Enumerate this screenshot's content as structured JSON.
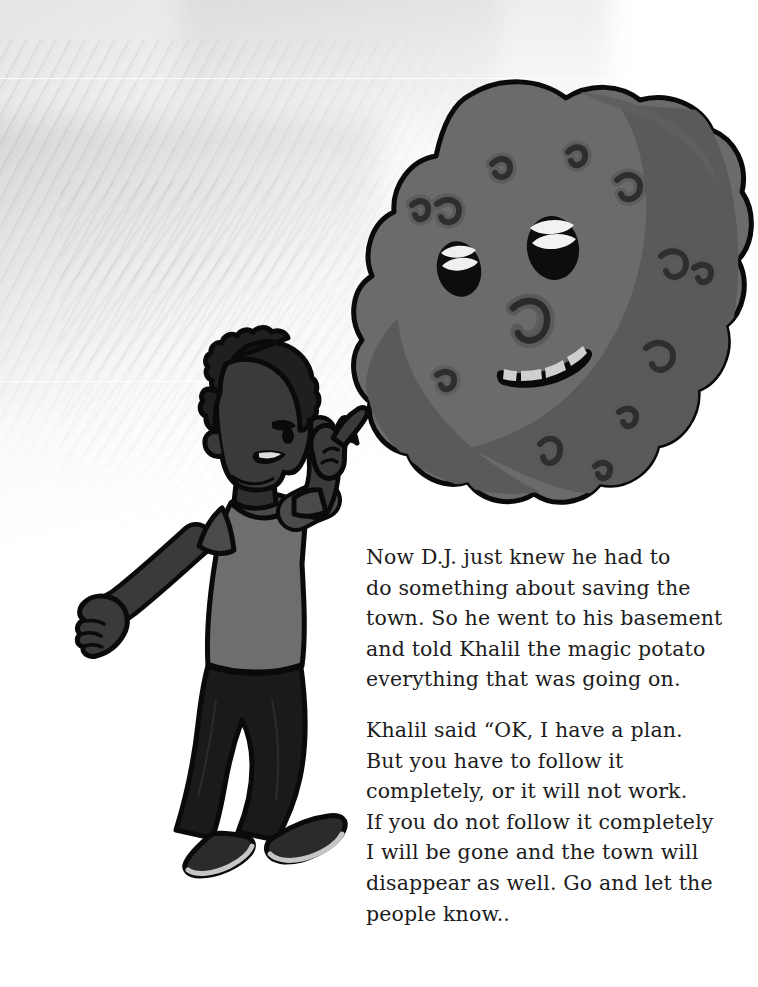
{
  "page": {
    "width": 758,
    "height": 987,
    "background_color": "#ffffff",
    "kind": "illustrated-storybook-page"
  },
  "palette": {
    "paper": "#ffffff",
    "wash_gray": "#c9c9c9",
    "ink_outline": "#000000",
    "potato_body": "#6b6b6b",
    "potato_shadow": "#5a5a5a",
    "potato_spot": "#3a3a3a",
    "potato_spot_halo": "#5f5f5f",
    "eye_black": "#0d0d0d",
    "eye_highlight": "#f2f2f2",
    "tooth": "#d4d4d4",
    "skin": "#3a3a3a",
    "hair": "#1f1f1f",
    "shirt": "#6e6e6e",
    "shirt_trim": "#4a4a4a",
    "pants": "#1a1a1a",
    "shoe": "#2b2b2b",
    "shoe_sole": "#c6c6c6",
    "text_color": "#1c1c1c"
  },
  "illustration": {
    "characters": [
      {
        "name": "boy",
        "label": "D.J.",
        "description": "Young boy in profile facing right, short curly hair, gray t-shirt, dark pants and shoes, right arm raised pointing upward with index finger, left arm hanging down with open hand",
        "pose": "pointing-right",
        "bounds": {
          "x": 80,
          "y": 345,
          "width": 290,
          "height": 530
        }
      },
      {
        "name": "potato",
        "label": "Khalil the magic potato",
        "description": "Large lumpy gray potato with a face: two black oval eyes with white highlight bands, a curled sprout nose, a wide curved toothy smile, and scattered dark sprout eyes across the skin",
        "expression": "smiling",
        "bounds": {
          "x": 380,
          "y": 78,
          "width": 365,
          "height": 420
        }
      }
    ]
  },
  "story": {
    "paragraphs": [
      "Now D.J. just knew he had to\ndo something about saving the\ntown. So he went to his basement\nand told Khalil the magic potato\neverything that was going on.",
      "Khalil said “OK, I have a plan.\nBut you have to follow it\ncompletely, or it will not work.\nIf you do not follow it completely\nI will be gone and the town will\ndisappear as well. Go and let the\npeople know.."
    ]
  }
}
